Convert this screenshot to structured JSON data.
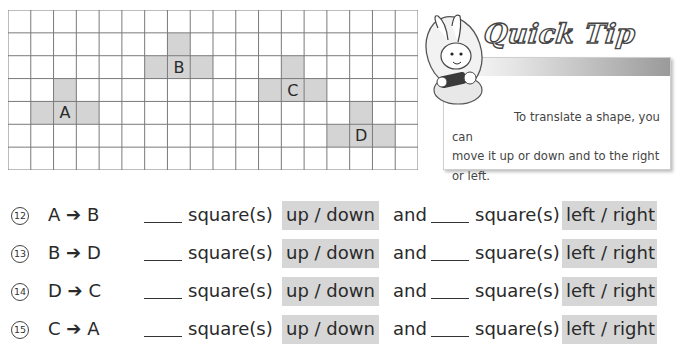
{
  "grid": {
    "columns": 18,
    "rows": 7,
    "shaded_fill": "#d4d4d4",
    "line_color": "#7a7a7a",
    "shapes": [
      {
        "label": "A",
        "cells": [
          [
            2,
            3
          ],
          [
            1,
            4
          ],
          [
            2,
            4
          ],
          [
            3,
            4
          ]
        ],
        "label_cell": [
          2,
          4
        ]
      },
      {
        "label": "B",
        "cells": [
          [
            7,
            1
          ],
          [
            6,
            2
          ],
          [
            7,
            2
          ],
          [
            8,
            2
          ]
        ],
        "label_cell": [
          7,
          2
        ]
      },
      {
        "label": "C",
        "cells": [
          [
            12,
            2
          ],
          [
            11,
            3
          ],
          [
            12,
            3
          ],
          [
            13,
            3
          ]
        ],
        "label_cell": [
          12,
          3
        ]
      },
      {
        "label": "D",
        "cells": [
          [
            15,
            4
          ],
          [
            14,
            5
          ],
          [
            15,
            5
          ],
          [
            16,
            5
          ]
        ],
        "label_cell": [
          15,
          5
        ]
      }
    ]
  },
  "tip": {
    "title": "Quick Tip",
    "line1": "To translate a shape, you can",
    "line2": "move it up or down and to the right",
    "line3": "or left."
  },
  "questions": [
    {
      "number": "12",
      "from": "A",
      "to": "B"
    },
    {
      "number": "13",
      "from": "B",
      "to": "D"
    },
    {
      "number": "14",
      "from": "D",
      "to": "C"
    },
    {
      "number": "15",
      "from": "C",
      "to": "A"
    }
  ],
  "labels": {
    "arrow": "➔",
    "squares": "square(s)",
    "vertical_choice": "up / down",
    "and": "and",
    "horizontal_choice": "left / right"
  }
}
